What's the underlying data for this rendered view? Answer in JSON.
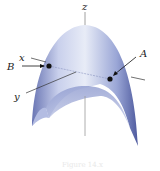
{
  "diagram": {
    "type": "3d-surface",
    "surface": "downward-opening paraboloid",
    "axes": {
      "z_label": "z",
      "x_label": "x",
      "y_label": "y"
    },
    "points": [
      {
        "label": "A",
        "desc": "point on surface (right)"
      },
      {
        "label": "B",
        "desc": "point on surface (left)"
      }
    ],
    "caption": "Figure 14.x",
    "colors": {
      "surface_light": "#e4e8f5",
      "surface_mid": "#a9b4dc",
      "surface_dark": "#5c67a8",
      "axis": "#888888",
      "point": "#111111"
    }
  }
}
